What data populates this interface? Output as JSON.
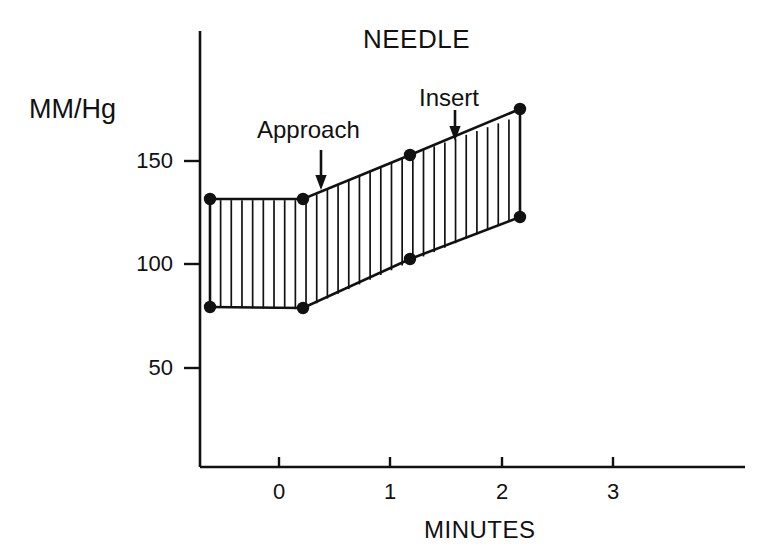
{
  "chart_data": {
    "type": "area",
    "title": "NEEDLE",
    "xlabel": "MINUTES",
    "ylabel": "MM/Hg",
    "xlim": [
      -0.95,
      3.75
    ],
    "ylim": [
      0,
      190
    ],
    "grid": false,
    "legend_position": "none",
    "xticks": [
      0,
      1,
      2,
      3
    ],
    "xtick_labels": [
      "0",
      "1",
      "2",
      "3"
    ],
    "yticks": [
      50,
      100,
      150
    ],
    "ytick_labels": [
      "50",
      "100",
      "150"
    ],
    "x": [
      -0.62,
      0.215,
      1.18,
      2.16
    ],
    "series": [
      {
        "name": "systolic",
        "values": [
          131,
          131,
          153,
          172
        ]
      },
      {
        "name": "diastolic",
        "values": [
          79,
          78,
          101,
          123
        ]
      }
    ],
    "fill_style": "vertical-hatch",
    "hatch_line_count": 29,
    "marker": "filled-circle",
    "annotations": [
      {
        "label": "Approach",
        "x": 0.37,
        "arrow_from_y": 171,
        "arrow_to_y": 152
      },
      {
        "label": "Insert",
        "x": 1.58,
        "arrow_from_y": 190,
        "arrow_to_y": 166
      }
    ]
  },
  "figure": {
    "title": "NEEDLE",
    "y_axis_title": "MM/Hg",
    "x_axis_title": "MINUTES",
    "y_tick_labels": [
      "150",
      "100",
      "50"
    ],
    "x_tick_labels": [
      "0",
      "1",
      "2",
      "3"
    ],
    "annotation_approach": "Approach",
    "annotation_insert": "Insert",
    "colors": {
      "ink": "#111111",
      "background": "#ffffff"
    }
  }
}
